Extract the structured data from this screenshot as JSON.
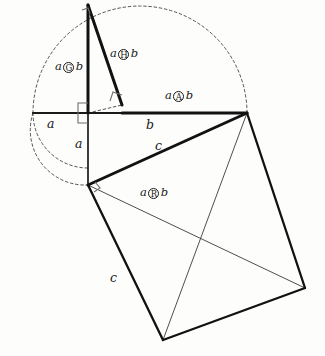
{
  "figure": {
    "background_color": "#fdfdfc",
    "ink_color": "#1a1a1a",
    "thin_color": "#3a3a3a"
  },
  "labels": {
    "op_g": {
      "left": "a",
      "operator": "G",
      "right": "b",
      "x": 55,
      "y": 61
    },
    "op_h": {
      "left": "a",
      "operator": "H",
      "right": "b",
      "x": 110,
      "y": 48
    },
    "op_a": {
      "left": "a",
      "operator": "A",
      "right": "b",
      "x": 165,
      "y": 90
    },
    "op_r": {
      "left": "a",
      "operator": "R",
      "right": "b",
      "x": 140,
      "y": 187
    },
    "seg_a_horizontal": {
      "text": "a",
      "x": 47,
      "y": 118
    },
    "seg_b_horizontal": {
      "text": "b",
      "x": 146,
      "y": 119
    },
    "seg_a_vertical": {
      "text": "a",
      "x": 75,
      "y": 138
    },
    "seg_c_upper": {
      "text": "c",
      "x": 155,
      "y": 140
    },
    "seg_c_lower": {
      "text": "c",
      "x": 110,
      "y": 272
    }
  },
  "geometry": {
    "origin": {
      "x": 88,
      "y": 113
    },
    "apex": {
      "x": 88,
      "y": 5
    },
    "left_end": {
      "x": 33,
      "y": 113
    },
    "right_end": {
      "x": 247,
      "y": 113
    },
    "foot": {
      "x": 122,
      "y": 105
    },
    "bottom_vertex": {
      "x": 88,
      "y": 185
    },
    "low_point": {
      "x": 163,
      "y": 340
    },
    "right_point": {
      "x": 305,
      "y": 288
    },
    "arc_radius": 55
  }
}
